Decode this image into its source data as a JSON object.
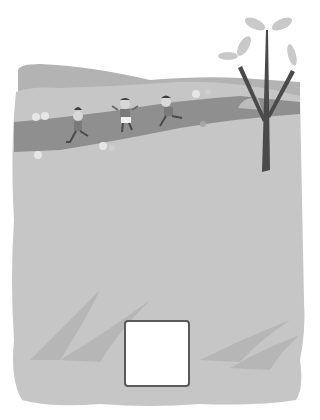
{
  "illustration": {
    "description": "Children running along a path in a field with a tree",
    "colors": {
      "background": "#ffffff",
      "ground": "#c6c6c6",
      "ground_top": "#bdbdbd",
      "hill_back": "#b3b3b3",
      "path": "#8f8f8f",
      "grass_streak": "#b6b6b6",
      "tree_trunk": "#4a4a4a",
      "leaf": "#c9c9c9",
      "flower": "#e6e6e6",
      "box_border": "#5a5a5a",
      "box_fill": "#ffffff"
    },
    "figures": [
      {
        "name": "child-left",
        "x": 78,
        "y": 120
      },
      {
        "name": "child-middle",
        "x": 125,
        "y": 108
      },
      {
        "name": "child-right",
        "x": 168,
        "y": 105
      }
    ],
    "answer_box": {
      "value": ""
    }
  }
}
